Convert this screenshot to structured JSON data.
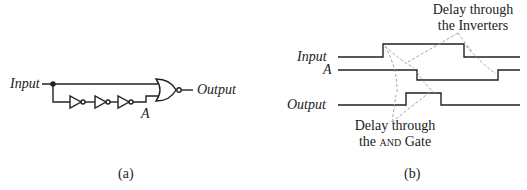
{
  "figure_a": {
    "input_label": "Input",
    "output_label": "Output",
    "node_label": "A",
    "caption": "(a)",
    "components": [
      "inverter",
      "inverter",
      "inverter",
      "nor-gate"
    ]
  },
  "figure_b": {
    "signals": [
      "Input",
      "A",
      "Output"
    ],
    "annotation_top": {
      "line1": "Delay through",
      "line2": "the Inverters"
    },
    "annotation_bottom": {
      "line1": "Delay through",
      "line2_prefix": "the ",
      "line2_sc": "AND",
      "line2_suffix": " Gate"
    },
    "caption": "(b)"
  },
  "colors": {
    "ink": "#222222",
    "dashed": "#999999"
  }
}
